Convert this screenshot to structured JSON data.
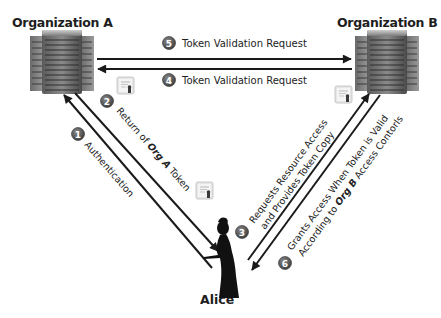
{
  "diagram": {
    "type": "federated-identity-token-flow",
    "nodes": {
      "org_a": {
        "label": "Organization A",
        "icon": "server-rack-icon"
      },
      "org_b": {
        "label": "Organization B",
        "icon": "server-rack-icon"
      },
      "alice": {
        "label": "Alice",
        "icon": "person-silhouette-icon"
      }
    },
    "steps": [
      {
        "number": "1",
        "label": "Authentication",
        "from": "alice",
        "to": "org_a"
      },
      {
        "number": "2",
        "label_prefix": "Return of ",
        "label_emph": "Org A",
        "label_suffix": " Token",
        "from": "org_a",
        "to": "alice"
      },
      {
        "number": "3",
        "label_line1": "Requests Resource Access",
        "label_line2": "and Provides Token Copy",
        "from": "alice",
        "to": "org_b"
      },
      {
        "number": "4",
        "label": "Token Validation Request",
        "from": "org_b",
        "to": "org_a"
      },
      {
        "number": "5",
        "label": "Token Validation Request",
        "from": "org_a",
        "to": "org_b"
      },
      {
        "number": "6",
        "label_line1": "Grants Access When Token is Valid",
        "label_line2_prefix": "According to ",
        "label_line2_emph": "Org B",
        "label_line2_suffix": " Access Contorls",
        "from": "org_b",
        "to": "alice"
      }
    ],
    "token_icons": [
      "certificate-icon",
      "certificate-icon",
      "certificate-icon",
      "certificate-icon"
    ],
    "colors": {
      "arrow": "#1a1a1a",
      "badge": "#4a4a4a",
      "text": "#222222",
      "server_dark": "#3c3c3c",
      "server_light": "#9a9a9a"
    }
  }
}
